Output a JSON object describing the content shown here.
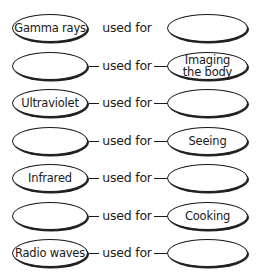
{
  "diagram": {
    "connector_label": "used for",
    "rows": [
      {
        "left": "Gamma rays",
        "right": "",
        "connected": false
      },
      {
        "left": "",
        "right": "Imaging the body",
        "connected": true
      },
      {
        "left": "Ultraviolet",
        "right": "",
        "connected": true
      },
      {
        "left": "",
        "right": "Seeing",
        "connected": true
      },
      {
        "left": "Infrared",
        "right": "",
        "connected": true
      },
      {
        "left": "",
        "right": "Cooking",
        "connected": true
      },
      {
        "left": "Radio waves",
        "right": "",
        "connected": true
      }
    ]
  }
}
